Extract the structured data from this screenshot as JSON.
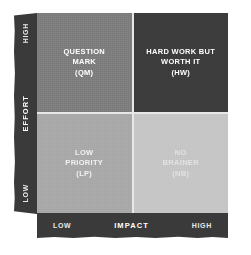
{
  "chart_data": {
    "type": "heatmap",
    "xlabel": "IMPACT",
    "ylabel": "EFFORT",
    "x_ticks": [
      "LOW",
      "HIGH"
    ],
    "y_ticks": [
      "LOW",
      "HIGH"
    ],
    "grid": false,
    "legend": "none",
    "categories": [
      "LOW IMPACT",
      "HIGH IMPACT"
    ],
    "series": [
      {
        "name": "HIGH EFFORT",
        "cells": [
          {
            "label": "QUESTION MARK (QM)",
            "x": "LOW",
            "y": "HIGH",
            "color": "#7e7e7e"
          },
          {
            "label": "HARD WORK BUT WORTH IT (HW)",
            "x": "HIGH",
            "y": "HIGH",
            "color": "#3c3c3c"
          }
        ]
      },
      {
        "name": "LOW EFFORT",
        "cells": [
          {
            "label": "LOW PRIORITY (LP)",
            "x": "LOW",
            "y": "LOW",
            "color": "#a9a9a9"
          },
          {
            "label": "NO BRAINER (NB)",
            "x": "HIGH",
            "y": "LOW",
            "color": "#c6c6c6"
          }
        ]
      }
    ]
  },
  "axes": {
    "y": {
      "title": "EFFORT",
      "high_label": "HIGH",
      "low_label": "LOW",
      "bar_color": "#3a3a3a"
    },
    "x": {
      "title": "IMPACT",
      "low_label": "LOW",
      "high_label": "HIGH",
      "bar_color": "#3a3a3a"
    }
  },
  "quadrants": {
    "question_mark": {
      "text": "QUESTION\nMARK\n(QM)",
      "color": "#7e7e7e"
    },
    "hard_work": {
      "text": "HARD WORK BUT\nWORTH IT\n(HW)",
      "color": "#3c3c3c"
    },
    "low_priority": {
      "text": "LOW\nPRIORITY\n(LP)",
      "color": "#a9a9a9"
    },
    "no_brainer": {
      "text": "NO\nBRAINER\n(NB)",
      "color": "#c6c6c6"
    }
  }
}
